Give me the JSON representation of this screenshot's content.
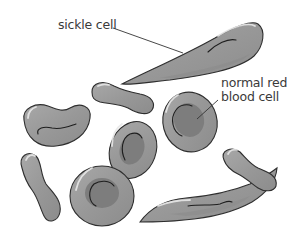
{
  "diagram": {
    "labels": {
      "sickle_cell": "sickle cell",
      "normal_rbc_line1": "normal red",
      "normal_rbc_line2": "blood cell"
    },
    "colors": {
      "cell_fill": "#9a9a9a",
      "cell_dark": "#7d7d7d",
      "outline": "#2e2e2e",
      "highlight": "#e8e8e8",
      "background": "#ffffff",
      "text": "#3a3a3a"
    },
    "cells": [
      {
        "type": "sickle",
        "position": "top"
      },
      {
        "type": "dumbbell",
        "position": "top-middle"
      },
      {
        "type": "kidney",
        "position": "left"
      },
      {
        "type": "normal",
        "position": "right-middle"
      },
      {
        "type": "normal",
        "position": "middle"
      },
      {
        "type": "dumbbell",
        "position": "left-vertical"
      },
      {
        "type": "normal",
        "position": "bottom"
      },
      {
        "type": "sickle",
        "position": "bottom-right"
      },
      {
        "type": "dumbbell",
        "position": "bottom-right-small"
      }
    ]
  }
}
